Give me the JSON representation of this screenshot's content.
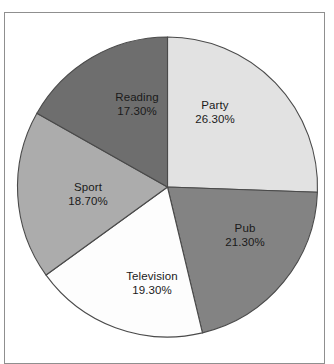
{
  "figure": {
    "background_color": "#ffffff",
    "frame_color": "#8f8f8f",
    "slice_outline_color": "#4a4a4a",
    "label_color": "#1a1a1a"
  },
  "chart_data": {
    "type": "pie",
    "title": "",
    "subtitle": "",
    "xlabel": "",
    "ylabel": "",
    "grid": false,
    "legend": false,
    "legend_position": "none",
    "start_angle_deg": 0,
    "direction": "clockwise",
    "units": "percent",
    "total": 102.9,
    "categories": [
      "Party",
      "Pub",
      "Television",
      "Sport",
      "Reading"
    ],
    "values": [
      26.3,
      21.3,
      19.3,
      18.7,
      17.3
    ],
    "value_labels": [
      "26.30%",
      "21.30%",
      "19.30%",
      "18.70%",
      "17.30%"
    ],
    "colors": [
      "#e2e2e2",
      "#838383",
      "#fdfdfd",
      "#acacac",
      "#6e6e6e"
    ],
    "slices": [
      {
        "label": "Party",
        "value": 26.3,
        "value_label": "26.30%",
        "color": "#e2e2e2",
        "label_x": 215,
        "label_y": 112
      },
      {
        "label": "Pub",
        "value": 21.3,
        "value_label": "21.30%",
        "color": "#838383",
        "label_x": 245,
        "label_y": 235
      },
      {
        "label": "Television",
        "value": 19.3,
        "value_label": "19.30%",
        "color": "#fdfdfd",
        "label_x": 152,
        "label_y": 283
      },
      {
        "label": "Sport",
        "value": 18.7,
        "value_label": "18.70%",
        "color": "#acacac",
        "label_x": 88,
        "label_y": 194
      },
      {
        "label": "Reading",
        "value": 17.3,
        "value_label": "17.30%",
        "color": "#6e6e6e",
        "label_x": 137,
        "label_y": 104
      }
    ],
    "geometry": {
      "center_x": 167.5,
      "center_y": 187,
      "radius": 150
    }
  }
}
